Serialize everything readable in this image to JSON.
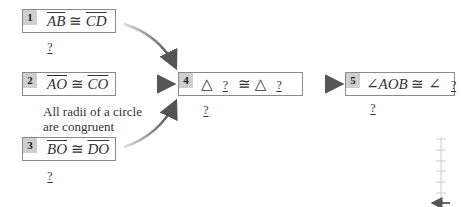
{
  "steps": [
    {
      "num": "1",
      "left": "AB",
      "op": "≅",
      "right": "CD",
      "reason": "?"
    },
    {
      "num": "2",
      "left": "AO",
      "op": "≅",
      "right": "CO",
      "reason": "All radii of a circle are congruent",
      "reason_line1": "All radii of a circle",
      "reason_line2": "are congruent"
    },
    {
      "num": "3",
      "left": "BO",
      "op": "≅",
      "right": "DO",
      "reason": "?"
    },
    {
      "num": "4",
      "tri1": "△",
      "blank1": "?",
      "op": "≅",
      "tri2": "△",
      "blank2": "?",
      "reason": "?"
    },
    {
      "num": "5",
      "angle_prefix": "∠AOB",
      "op": "≅",
      "angle2": "∠",
      "blank": "?",
      "reason": "?"
    }
  ],
  "colors": {
    "box_border": "#8a8a8a",
    "num_bg": "#cfcfcf",
    "arrow": "#555555"
  }
}
